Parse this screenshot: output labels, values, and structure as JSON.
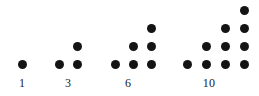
{
  "figure": {
    "width": 259,
    "height": 96,
    "background_color": "#ffffff",
    "dot_color": "#141414",
    "label_color": "#1a1a1a",
    "dot_diameter": 9
  },
  "chart_data": {
    "type": "scatter",
    "xlabel": "",
    "ylabel": "",
    "grid": false,
    "legend": null,
    "categories": [
      "1",
      "3",
      "6",
      "10"
    ],
    "values": [
      1,
      3,
      6,
      10
    ],
    "series": [
      {
        "name": "1",
        "label": "1",
        "dot_count": 1,
        "rows": [
          1
        ],
        "label_x": 22,
        "label_y": 77,
        "points": [
          {
            "x": 22,
            "y": 64
          }
        ]
      },
      {
        "name": "3",
        "label": "3",
        "dot_count": 3,
        "rows": [
          2,
          1
        ],
        "label_x": 68,
        "label_y": 77,
        "points": [
          {
            "x": 59,
            "y": 64
          },
          {
            "x": 77,
            "y": 64
          },
          {
            "x": 77,
            "y": 46
          }
        ]
      },
      {
        "name": "6",
        "label": "6",
        "dot_count": 6,
        "rows": [
          3,
          2,
          1
        ],
        "label_x": 128,
        "label_y": 77,
        "points": [
          {
            "x": 115,
            "y": 64
          },
          {
            "x": 133,
            "y": 64
          },
          {
            "x": 151,
            "y": 64
          },
          {
            "x": 133,
            "y": 46
          },
          {
            "x": 151,
            "y": 46
          },
          {
            "x": 151,
            "y": 28
          }
        ]
      },
      {
        "name": "10",
        "label": "10",
        "dot_count": 10,
        "rows": [
          4,
          3,
          2,
          1
        ],
        "label_x": 209,
        "label_y": 77,
        "points": [
          {
            "x": 187,
            "y": 64
          },
          {
            "x": 206,
            "y": 64
          },
          {
            "x": 225,
            "y": 64
          },
          {
            "x": 244,
            "y": 64
          },
          {
            "x": 206,
            "y": 46
          },
          {
            "x": 225,
            "y": 46
          },
          {
            "x": 244,
            "y": 46
          },
          {
            "x": 225,
            "y": 28
          },
          {
            "x": 244,
            "y": 28
          },
          {
            "x": 244,
            "y": 10
          }
        ]
      }
    ]
  }
}
